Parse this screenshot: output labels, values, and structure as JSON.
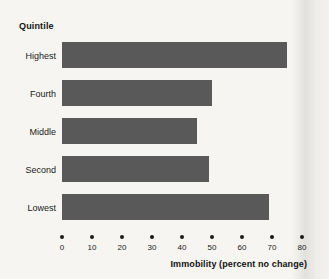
{
  "chart_data": {
    "type": "bar",
    "orientation": "horizontal",
    "title": "",
    "group_title": "Quintile",
    "categories": [
      "Highest",
      "Fourth",
      "Middle",
      "Second",
      "Lowest"
    ],
    "values": [
      75,
      50,
      45,
      49,
      69
    ],
    "xlabel": "Immobility (percent no change)",
    "ylabel": "Quintile",
    "xlim": [
      0,
      80
    ],
    "xticks": [
      0,
      10,
      20,
      30,
      40,
      50,
      60,
      70,
      80
    ],
    "xtick_labels": [
      "0",
      "10",
      "20",
      "30",
      "40",
      "50",
      "60",
      "70",
      "80"
    ],
    "grid": false,
    "legend": null,
    "tick_marker_style": "dot",
    "bar_color": "#595959",
    "background_color": "#f6f5f1",
    "text_color": "#1a1a1a"
  }
}
